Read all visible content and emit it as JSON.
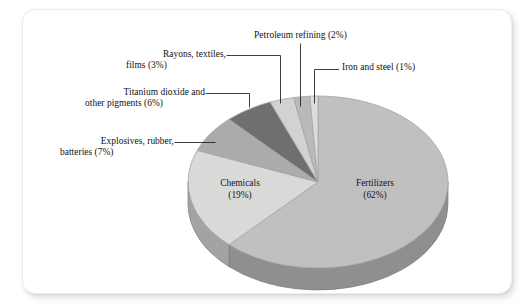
{
  "page": {
    "background_color": "#ffffff",
    "card_background": "#ffffff",
    "card_border_color": "#ececed"
  },
  "chart_data": {
    "type": "pie",
    "title": "",
    "subtitle": "",
    "xlabel": "",
    "ylabel": "",
    "legend_position": "none",
    "grid": false,
    "style": "3d-pie",
    "start_angle_deg": 0,
    "direction": "clockwise",
    "total_percent": 100,
    "units": "percent",
    "categories": [
      "Fertilizers",
      "Chemicals",
      "Explosives, rubber, batteries",
      "Titanium dioxide and other pigments",
      "Rayons, textiles, films",
      "Petroleum refining",
      "Iron and steel"
    ],
    "values": [
      62,
      19,
      7,
      6,
      3,
      2,
      1
    ],
    "colors": [
      "#c0c0c0",
      "#d9d9d7",
      "#ababab",
      "#6f6f6f",
      "#d2d2d0",
      "#b9b9b7",
      "#dcdcda"
    ],
    "slices": [
      {
        "name": "Fertilizers",
        "value": 62,
        "label": "Fertilizers",
        "percent_label": "(62%)",
        "color": "#c0c0c0",
        "side_color": "#8f8f8f",
        "label_placement": "inside"
      },
      {
        "name": "Chemicals",
        "value": 19,
        "label": "Chemicals",
        "percent_label": "(19%)",
        "color": "#d9d9d7",
        "side_color": "#a3a3a1",
        "label_placement": "inside"
      },
      {
        "name": "Explosives, rubber, batteries",
        "value": 7,
        "label_line1": "Explosives, rubber,",
        "label_line2": "batteries (7%)",
        "percent_label": "(7%)",
        "color": "#ababab",
        "side_color": "#808080",
        "label_placement": "outside-left"
      },
      {
        "name": "Titanium dioxide and other pigments",
        "value": 6,
        "label_line1": "Titanium dioxide and",
        "label_line2": "other pigments (6%)",
        "percent_label": "(6%)",
        "color": "#6f6f6f",
        "side_color": "#555555",
        "label_placement": "outside-left"
      },
      {
        "name": "Rayons, textiles, films",
        "value": 3,
        "label_line1": "Rayons, textiles,",
        "label_line2": "films (3%)",
        "percent_label": "(3%)",
        "color": "#d2d2d0",
        "side_color": "#9d9d9b",
        "label_placement": "outside-left"
      },
      {
        "name": "Petroleum refining",
        "value": 2,
        "label_line1": "Petroleum refining (2%)",
        "percent_label": "(2%)",
        "color": "#b9b9b7",
        "side_color": "#8a8a88",
        "label_placement": "outside-top"
      },
      {
        "name": "Iron and steel",
        "value": 1,
        "label_line1": "Iron and steel (1%)",
        "percent_label": "(1%)",
        "color": "#dcdcda",
        "side_color": "#a6a6a4",
        "label_placement": "outside-right"
      }
    ]
  },
  "labels": {
    "petroleum": "Petroleum refining (2%)",
    "iron": "Iron and steel (1%)",
    "rayons_l1": "Rayons, textiles,",
    "rayons_l2": "films (3%)",
    "titanium_l1": "Titanium dioxide and",
    "titanium_l2": "other pigments (6%)",
    "explosives_l1": "Explosives, rubber,",
    "explosives_l2": "batteries (7%)",
    "chemicals_l1": "Chemicals",
    "chemicals_l2": "(19%)",
    "fertilizers_l1": "Fertilizers",
    "fertilizers_l2": "(62%)"
  }
}
